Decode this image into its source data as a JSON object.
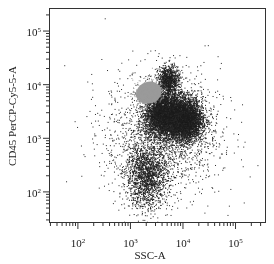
{
  "chart_data": {
    "type": "scatter",
    "title": "",
    "xlabel": "SSC-A",
    "ylabel": "CD45 PerCP-Cy5-5-A",
    "x_scale": "log",
    "y_scale": "log",
    "xlim_log10": [
      1.45,
      5.58
    ],
    "ylim_log10": [
      1.42,
      5.43
    ],
    "x_ticks": [
      {
        "label_base": "10",
        "label_exp": "2",
        "log10": 2
      },
      {
        "label_base": "10",
        "label_exp": "3",
        "log10": 3
      },
      {
        "label_base": "10",
        "label_exp": "4",
        "log10": 4
      },
      {
        "label_base": "10",
        "label_exp": "5",
        "log10": 5
      }
    ],
    "y_ticks": [
      {
        "label_base": "10",
        "label_exp": "2",
        "log10": 2
      },
      {
        "label_base": "10",
        "label_exp": "3",
        "log10": 3
      },
      {
        "label_base": "10",
        "label_exp": "4",
        "log10": 4
      },
      {
        "label_base": "10",
        "label_exp": "5",
        "log10": 5
      }
    ],
    "grid": false,
    "legend": null,
    "populations": [
      {
        "name": "gated population (gray)",
        "color": "#9a9a9a",
        "center_log10": [
          3.35,
          3.85
        ],
        "spread_log10": [
          0.16,
          0.13
        ],
        "n": 900,
        "solid": true
      },
      {
        "name": "dark cluster A",
        "color": "#1e1e1e",
        "center_log10": [
          3.62,
          3.45
        ],
        "spread_log10": [
          0.17,
          0.2
        ],
        "n": 4200
      },
      {
        "name": "dark cluster B",
        "color": "#1e1e1e",
        "center_log10": [
          4.02,
          3.35
        ],
        "spread_log10": [
          0.17,
          0.2
        ],
        "n": 4200
      },
      {
        "name": "upper spike",
        "color": "#1e1e1e",
        "center_log10": [
          3.72,
          4.08
        ],
        "spread_log10": [
          0.1,
          0.14
        ],
        "n": 900
      },
      {
        "name": "lower cluster",
        "color": "#1e1e1e",
        "center_log10": [
          3.3,
          2.3
        ],
        "spread_log10": [
          0.2,
          0.3
        ],
        "n": 1600
      },
      {
        "name": "diffuse background",
        "color": "#2a2a2a",
        "center_log10": [
          3.6,
          3.1
        ],
        "spread_log10": [
          0.55,
          0.6
        ],
        "n": 1800
      }
    ]
  }
}
